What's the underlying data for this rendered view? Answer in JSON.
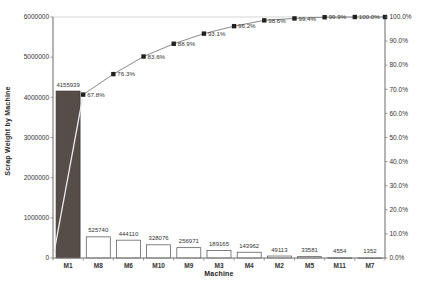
{
  "chart": {
    "x_axis_title": "Machine",
    "y_axis_title": "Scrap Weight by Machine"
  },
  "chart_data": {
    "type": "pareto-bar-line",
    "title": "",
    "xlabel": "Machine",
    "ylabel_left": "Scrap Weight by Machine",
    "categories": [
      "M1",
      "M8",
      "M6",
      "M10",
      "M9",
      "M3",
      "M4",
      "M2",
      "M5",
      "M11",
      "M7"
    ],
    "values": [
      4155939,
      525740,
      444110,
      328076,
      256971,
      189165,
      143962,
      49113,
      33581,
      4554,
      1352
    ],
    "value_labels": [
      "4155939",
      "525740",
      "444110",
      "328076",
      "256971",
      "189165",
      "143962",
      "49113",
      "33581",
      "4554",
      "1352"
    ],
    "cumulative_pct": [
      67.8,
      76.3,
      83.6,
      88.9,
      93.1,
      96.2,
      98.6,
      99.4,
      99.9,
      100.0,
      100.0
    ],
    "cumulative_labels": [
      "67.8%",
      "76.3%",
      "83.6%",
      "88.9%",
      "93.1%",
      "96.2%",
      "98.6%",
      "99.4%",
      "99.9%",
      "100.0%",
      ""
    ],
    "ylim_left": [
      0,
      6000000
    ],
    "ylim_right_pct": [
      0,
      100
    ],
    "left_axis_ticks": [
      "0",
      "1000000",
      "2000000",
      "3000000",
      "4000000",
      "5000000",
      "6000000"
    ],
    "right_axis_ticks": [
      "0.0%",
      "10.0%",
      "20.0%",
      "30.0%",
      "40.0%",
      "50.0%",
      "60.0%",
      "70.0%",
      "80.0%",
      "90.0%",
      "100.0%"
    ],
    "grid": false,
    "legend": "none",
    "colors": {
      "highlight_bar": "#564c48",
      "highlight_bar_border": "#3c3431",
      "bar_fill": "#ffffff",
      "bar_border": "#4d4d4d",
      "line": "#8a8a8a",
      "line_over_highlight_bar": "#ededed",
      "marker": "#212121",
      "axis": "#7f7f7f",
      "plot_border": "#cccccc",
      "text": "#333333"
    }
  }
}
